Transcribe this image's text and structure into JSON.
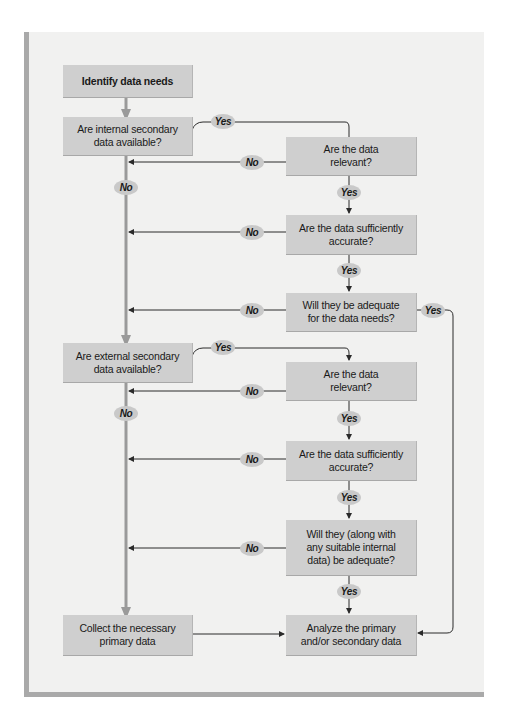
{
  "diagram": {
    "type": "flowchart",
    "nodes": {
      "identify": "Identify data needs",
      "internal_available": "Are internal secondary data available?",
      "internal_relevant": "Are the data relevant?",
      "internal_accurate": "Are the data sufficiently accurate?",
      "internal_adequate": "Will they be adequate for the data needs?",
      "external_available": "Are external secondary data available?",
      "external_relevant": "Are the data relevant?",
      "external_accurate": "Are the data sufficiently accurate?",
      "external_adequate": "Will they (along with any suitable internal data) be adequate?",
      "collect_primary": "Collect the necessary primary data",
      "analyze": "Analyze the primary and/or secondary data"
    },
    "labels": {
      "yes": "Yes",
      "no": "No"
    },
    "edges": [
      {
        "from": "identify",
        "to": "internal_available",
        "label": ""
      },
      {
        "from": "internal_available",
        "to": "internal_relevant",
        "label": "Yes"
      },
      {
        "from": "internal_available",
        "to": "external_available",
        "label": "No"
      },
      {
        "from": "internal_relevant",
        "to": "internal_accurate",
        "label": "Yes"
      },
      {
        "from": "internal_relevant",
        "to": "external_available",
        "label": "No"
      },
      {
        "from": "internal_accurate",
        "to": "internal_adequate",
        "label": "Yes"
      },
      {
        "from": "internal_accurate",
        "to": "external_available",
        "label": "No"
      },
      {
        "from": "internal_adequate",
        "to": "analyze",
        "label": "Yes"
      },
      {
        "from": "internal_adequate",
        "to": "external_available",
        "label": "No"
      },
      {
        "from": "external_available",
        "to": "external_relevant",
        "label": "Yes"
      },
      {
        "from": "external_available",
        "to": "collect_primary",
        "label": "No"
      },
      {
        "from": "external_relevant",
        "to": "external_accurate",
        "label": "Yes"
      },
      {
        "from": "external_relevant",
        "to": "collect_primary",
        "label": "No"
      },
      {
        "from": "external_accurate",
        "to": "external_adequate",
        "label": "Yes"
      },
      {
        "from": "external_accurate",
        "to": "collect_primary",
        "label": "No"
      },
      {
        "from": "external_adequate",
        "to": "analyze",
        "label": "Yes"
      },
      {
        "from": "external_adequate",
        "to": "collect_primary",
        "label": "No"
      },
      {
        "from": "collect_primary",
        "to": "analyze",
        "label": ""
      }
    ],
    "colors": {
      "panel_bg": "#f1f1f0",
      "box_fill": "#cfcfcf",
      "pill_fill": "#c9c9c9",
      "main_line": "#9a9a9a",
      "thin_line": "#2a2a2a"
    }
  }
}
